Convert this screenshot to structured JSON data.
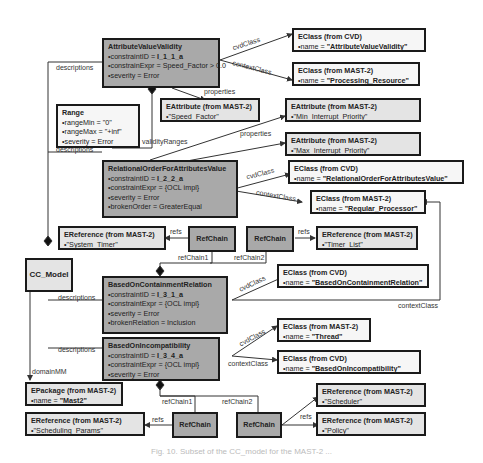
{
  "diagram": {
    "caption": "Fig. 10. Subset of the CC_model for the MAST-2 ...",
    "colors": {
      "constraint_box": "#a9a9a9",
      "reference_box": "#e4e4e4",
      "border": "#1a1a1a"
    },
    "root": {
      "name": "CC_Model"
    },
    "constraints": [
      {
        "id": "avv",
        "title": "AttributeValueValidity",
        "attrs": [
          "constraintID = ",
          "constrainExpr = Speed_Factor > 0.0",
          "severity = Error"
        ],
        "constraintID": "I_1_1_a"
      },
      {
        "id": "roav",
        "title": "RelationalOrderForAttributesValue",
        "attrs": [
          "constraintID = ",
          "constraintExpr = {OCL impl}",
          "severity = Error",
          "brokenOrder = GreaterEqual"
        ],
        "constraintID": "I_2_2_a"
      },
      {
        "id": "bocr",
        "title": "BasedOnContainmentRelation",
        "attrs": [
          "constraintID = ",
          "constraintExpr = {OCL impl}",
          "severity = Error",
          "brokenRelation = Inclusion"
        ],
        "constraintID": "I_3_1_a"
      },
      {
        "id": "boi",
        "title": "BasedOnIncompatibility",
        "attrs": [
          "constraintID = ",
          "constraintExpr = {OCL impl}",
          "severity = Error"
        ],
        "constraintID": "I_3_4_a"
      }
    ],
    "range": {
      "title": "Range",
      "attrs": [
        "rangeMin = \"0\"",
        "rangeMax = \"+inf\"",
        "severity = Error"
      ]
    },
    "refchains": [
      "RefChain",
      "RefChain",
      "RefChain",
      "RefChain"
    ],
    "elements": [
      {
        "title": "EClass (from CVD)",
        "prefix": "name = ",
        "value": "\"AttributeValueValidity\""
      },
      {
        "title": "EClass (from MAST-2)",
        "prefix": "name = ",
        "value": "\"Processing_Resource\""
      },
      {
        "title": "EAttribute (from MAST-2)",
        "prefix": "name = ",
        "value": "\"Speed_Factor\""
      },
      {
        "title": "EAttribute (from MAST-2)",
        "prefix": "name = ",
        "value": "\"Min_Interrupt_Priority\""
      },
      {
        "title": "EAttribute (from MAST-2)",
        "prefix": "name = ",
        "value": "\"Max_Interrupt_Priority\""
      },
      {
        "title": "EClass (from CVD)",
        "prefix": "name = ",
        "value": "\"RelationalOrderForAttributesValue\""
      },
      {
        "title": "EClass (from MAST-2)",
        "prefix": "name = ",
        "value": "\"Regular_Processor\""
      },
      {
        "title": "EReference (from MAST-2)",
        "prefix": "name = ",
        "value": "\"System_Timer\""
      },
      {
        "title": "EReference (from MAST-2)",
        "prefix": "name = ",
        "value": "\"Timer_List\""
      },
      {
        "title": "EClass (from CVD)",
        "prefix": "name = ",
        "value": "\"BasedOnContainmentRelation\""
      },
      {
        "title": "EClass (from MAST-2)",
        "prefix": "name = ",
        "value": "\"Thread\""
      },
      {
        "title": "EClass (from CVD)",
        "prefix": "name = ",
        "value": "\"BasedOnIncompatibility\""
      },
      {
        "title": "EPackage (from MAST-2)",
        "prefix": "name = ",
        "value": "\"Mast2\""
      },
      {
        "title": "EReference (from MAST-2)",
        "prefix": "name = ",
        "value": "\"Scheduling_Params\""
      },
      {
        "title": "EReference (from MAST-2)",
        "prefix": "name = ",
        "value": "\"Scheduler\""
      },
      {
        "title": "EReference (from MAST-2)",
        "prefix": "name = ",
        "value": "\"Policy\""
      }
    ],
    "labels": {
      "descriptions": "descriptions",
      "cvdClass": "cvdClass",
      "contextClass": "contextClass",
      "properties": "properties",
      "validityRanges": "validityRanges",
      "refs": "refs",
      "refChain1": "refChain1",
      "refChain2": "refChain2",
      "domainMM": "domainMM"
    }
  }
}
